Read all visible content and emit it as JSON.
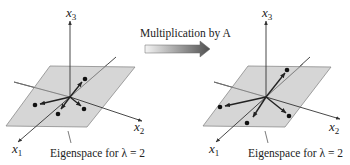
{
  "title": "Multiplication by A",
  "colors": {
    "plane_fill": "#cfcfcf",
    "plane_stroke": "#8a8a8a",
    "axis": "#333333",
    "vector": "#2a2a2a",
    "dot": "#111111",
    "arrow_gradient_start": "#f2f2f2",
    "arrow_gradient_end": "#555555"
  },
  "panels": [
    {
      "name": "before",
      "axes": {
        "x1": {
          "var": "x",
          "sub": "1"
        },
        "x2": {
          "var": "x",
          "sub": "2"
        },
        "x3": {
          "var": "x",
          "sub": "3"
        }
      },
      "caption": "Eigenspace for λ = 2",
      "vector_count": 4
    },
    {
      "name": "after",
      "axes": {
        "x1": {
          "var": "x",
          "sub": "1"
        },
        "x2": {
          "var": "x",
          "sub": "2"
        },
        "x3": {
          "var": "x",
          "sub": "3"
        }
      },
      "caption": "Eigenspace for λ = 2",
      "vector_count": 4
    }
  ]
}
